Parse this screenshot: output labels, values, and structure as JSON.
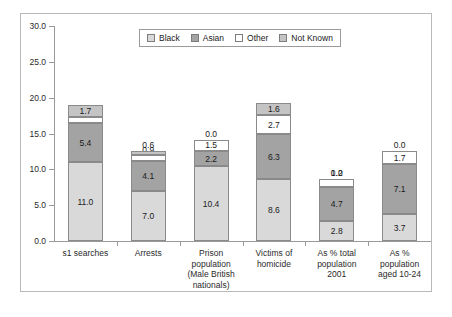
{
  "chart_data": {
    "type": "bar",
    "subtype": "stacked-vertical",
    "title": "",
    "xlabel": "",
    "ylabel": "",
    "ylim": [
      0.0,
      30.0
    ],
    "ytick_labels": [
      "0.0",
      "5.0",
      "10.0",
      "15.0",
      "20.0",
      "25.0",
      "30.0"
    ],
    "ytick_values": [
      0,
      5,
      10,
      15,
      20,
      25,
      30
    ],
    "grid": false,
    "legend_position": "top-center",
    "categories": [
      "s1 searches",
      "Arrests",
      "Prison population (Male British nationals)",
      "Victims of homicide",
      "As % total population 2001",
      "As % population aged 10-24"
    ],
    "category_lines": [
      [
        "s1 searches"
      ],
      [
        "Arrests"
      ],
      [
        "Prison",
        "population",
        "(Male British",
        "nationals)"
      ],
      [
        "Victims of",
        "homicide"
      ],
      [
        "As % total",
        "population",
        "2001"
      ],
      [
        "As %",
        "population",
        "aged 10-24"
      ]
    ],
    "series": [
      {
        "name": "Black",
        "color": "#d9d9d9",
        "values": [
          11.0,
          7.0,
          10.4,
          8.6,
          2.8,
          3.7
        ],
        "labels": [
          "11.0",
          "7.0",
          "10.4",
          "8.6",
          "2.8",
          "3.7"
        ]
      },
      {
        "name": "Asian",
        "color": "#a3a3a3",
        "values": [
          5.4,
          4.1,
          2.2,
          6.3,
          4.7,
          7.1
        ],
        "labels": [
          "5.4",
          "4.1",
          "2.2",
          "6.3",
          "4.7",
          "7.1"
        ]
      },
      {
        "name": "Other",
        "color": "#ffffff",
        "values": [
          0.9,
          0.9,
          1.5,
          2.7,
          1.2,
          1.7
        ],
        "labels": [
          "0.9",
          "0.9",
          "1.5",
          "2.7",
          "1.2",
          "1.7"
        ]
      },
      {
        "name": "Not Known",
        "color": "#c4c4c4",
        "values": [
          1.7,
          0.6,
          0.0,
          1.6,
          0.0,
          0.0
        ],
        "labels": [
          "1.7",
          "0.6",
          "0.0",
          "1.6",
          "0.0",
          "0.0"
        ]
      }
    ],
    "totals": [
      19.0,
      12.6,
      14.1,
      19.2,
      8.7,
      12.5
    ]
  },
  "legend": {
    "items": [
      {
        "label": "Black",
        "color": "#d9d9d9"
      },
      {
        "label": "Asian",
        "color": "#a3a3a3"
      },
      {
        "label": "Other",
        "color": "#ffffff"
      },
      {
        "label": "Not Known",
        "color": "#c4c4c4"
      }
    ]
  },
  "colors": {
    "frame_border": "#b9b9b9",
    "axis": "#9a9a9a",
    "bar_border": "#8a8a8a",
    "text": "#1a1a1a",
    "background": "#ffffff"
  }
}
